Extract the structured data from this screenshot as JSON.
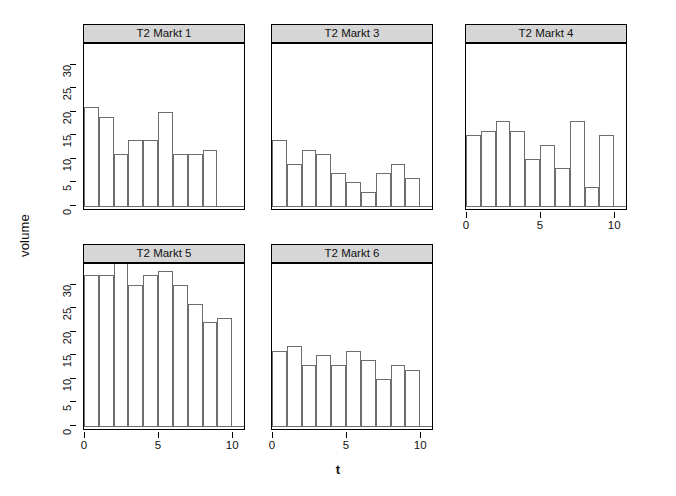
{
  "chart_data": {
    "type": "bar",
    "title": "",
    "xlabel": "t",
    "ylabel": "volume",
    "grid": false,
    "legend": "none",
    "layout": "2 rows x 3 columns trellis (lattice) of histograms",
    "ylim": [
      0,
      34
    ],
    "xlim": [
      0,
      10.8
    ],
    "yticks": [
      0,
      5,
      10,
      15,
      20,
      25,
      30
    ],
    "xticks": [
      0,
      5,
      10
    ],
    "panels": [
      {
        "strip": "T2 Markt 1",
        "row": 0,
        "col": 0,
        "x": [
          1,
          2,
          3,
          4,
          5,
          6,
          7,
          8,
          9
        ],
        "values": [
          21,
          19,
          11,
          14,
          14,
          20,
          11,
          11,
          12
        ],
        "last_partial": 10,
        "last_value": 10
      },
      {
        "strip": "T2 Markt 3",
        "row": 0,
        "col": 1,
        "x": [
          1,
          2,
          3,
          4,
          5,
          6,
          7,
          8,
          9,
          10
        ],
        "values": [
          14,
          9,
          12,
          11,
          7,
          5,
          3,
          7,
          9,
          6
        ]
      },
      {
        "strip": "T2 Markt 4",
        "row": 0,
        "col": 2,
        "x": [
          1,
          2,
          3,
          4,
          5,
          6,
          7,
          8,
          9,
          10
        ],
        "values": [
          15,
          16,
          18,
          16,
          10,
          13,
          8,
          18,
          4,
          15
        ]
      },
      {
        "strip": "T2 Markt 5",
        "row": 1,
        "col": 0,
        "x": [
          1,
          2,
          3,
          4,
          5,
          6,
          7,
          8,
          9,
          10
        ],
        "values": [
          32,
          32,
          35,
          30,
          32,
          33,
          30,
          26,
          22,
          23
        ]
      },
      {
        "strip": "T2 Markt 6",
        "row": 1,
        "col": 1,
        "x": [
          1,
          2,
          3,
          4,
          5,
          6,
          7,
          8,
          9,
          10
        ],
        "values": [
          16,
          17,
          13,
          15,
          13,
          16,
          14,
          10,
          13,
          12
        ]
      }
    ]
  },
  "axes": {
    "ylabel": "volume",
    "xlabel": "t",
    "ytick_labels": [
      "0",
      "5",
      "10",
      "15",
      "20",
      "25",
      "30"
    ],
    "xtick_labels": [
      "0",
      "5",
      "10"
    ]
  },
  "strips": {
    "p1": "T2 Markt 1",
    "p3": "T2 Markt 3",
    "p4": "T2 Markt 4",
    "p5": "T2 Markt 5",
    "p6": "T2 Markt 6"
  },
  "colors": {
    "strip_background": "#d6d6d6",
    "bar_fill": "#ffffff",
    "bar_border": "#6d6d6d",
    "frame": "#000000",
    "text": "#111111",
    "page_background": "#ffffff"
  }
}
